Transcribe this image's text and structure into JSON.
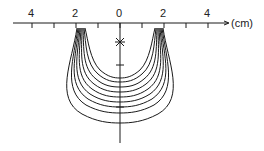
{
  "axis": {
    "unit_label": "(cm)",
    "tick_labels": [
      {
        "text": "4",
        "x": 32
      },
      {
        "text": "2",
        "x": 76
      },
      {
        "text": "0",
        "x": 120
      },
      {
        "text": "2",
        "x": 164
      },
      {
        "text": "4",
        "x": 208
      }
    ]
  },
  "marker": {
    "symbol": "✳",
    "description": "source point on central axis"
  },
  "curves": {
    "count": 9
  },
  "colors": {
    "line": "#1a1a1a",
    "background": "#ffffff"
  }
}
